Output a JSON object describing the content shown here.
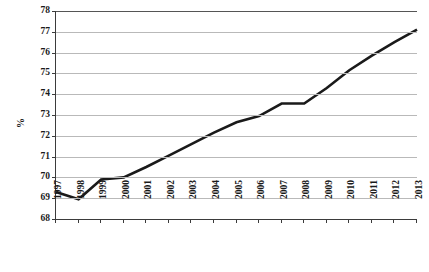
{
  "chart_data": {
    "type": "line",
    "title": "",
    "subtitle": "",
    "xlabel": "",
    "ylabel": "%",
    "categories": [
      "1997",
      "1998",
      "1999",
      "2000",
      "2001",
      "2002",
      "2003",
      "2004",
      "2005",
      "2006",
      "2007",
      "2008",
      "2009",
      "2010",
      "2011",
      "2012",
      "2013"
    ],
    "x": [
      1997,
      1998,
      1999,
      2000,
      2001,
      2002,
      2003,
      2004,
      2005,
      2006,
      2007,
      2008,
      2009,
      2010,
      2011,
      2012,
      2013
    ],
    "values": [
      69.3,
      68.95,
      69.9,
      70.0,
      70.5,
      71.05,
      71.6,
      72.15,
      72.65,
      72.95,
      73.55,
      73.55,
      74.3,
      75.15,
      75.85,
      76.5,
      77.1
    ],
    "series": [
      {
        "name": "%",
        "values": [
          69.3,
          68.95,
          69.9,
          70.0,
          70.5,
          71.05,
          71.6,
          72.15,
          72.65,
          72.95,
          73.55,
          73.55,
          74.3,
          75.15,
          75.85,
          76.5,
          77.1
        ]
      }
    ],
    "ylim": [
      68,
      78
    ],
    "yticks": [
      68,
      69,
      70,
      71,
      72,
      73,
      74,
      75,
      76,
      77,
      78
    ],
    "ytick_labels": [
      "68",
      "69",
      "70",
      "71",
      "72",
      "73",
      "74",
      "75",
      "76",
      "77",
      "78"
    ],
    "xlim": [
      1997,
      2013
    ],
    "grid": true,
    "grid_axis": "y",
    "legend": false,
    "legend_position": "none",
    "line_color": "#1a1a1a",
    "grid_color": "#b9b9b9",
    "axis_color": "#3b3b3b",
    "background_color": "#ffffff",
    "line_width": 2.6,
    "markers": false,
    "annotations": []
  }
}
